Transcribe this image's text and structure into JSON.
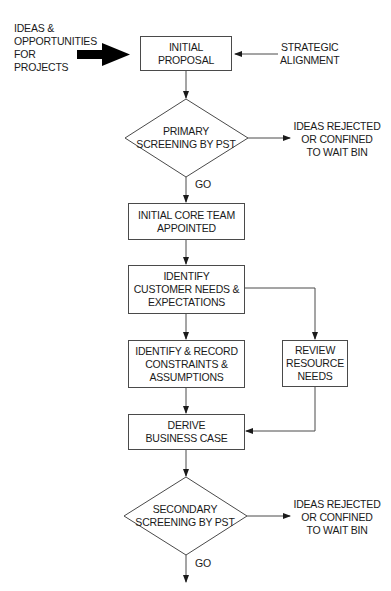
{
  "diagram": {
    "type": "flowchart",
    "inputs": {
      "ideas": "IDEAS &\nOPPORTUNITIES\nFOR\nPROJECTS",
      "strategic": "STRATEGIC\nALIGNMENT"
    },
    "nodes": {
      "initial_proposal": "INITIAL\nPROPOSAL",
      "primary_screening": "PRIMARY\nSCREENING BY PST",
      "core_team": "INITIAL CORE TEAM\nAPPOINTED",
      "customer_needs": "IDENTIFY\nCUSTOMER NEEDS &\nEXPECTATIONS",
      "constraints": "IDENTIFY & RECORD\nCONSTRAINTS &\nASSUMPTIONS",
      "resource_needs": "REVIEW\nRESOURCE\nNEEDS",
      "business_case": "DERIVE\nBUSINESS CASE",
      "secondary_screening": "SECONDARY\nSCREENING BY PST"
    },
    "outcomes": {
      "rejected_1": "IDEAS REJECTED\nOR CONFINED\nTO WAIT BIN",
      "rejected_2": "IDEAS REJECTED\nOR CONFINED\nTO WAIT BIN",
      "go_1": "GO",
      "go_2": "GO"
    },
    "colors": {
      "line": "#4a4a4a",
      "text": "#1a1a1a",
      "background": "#ffffff"
    }
  }
}
